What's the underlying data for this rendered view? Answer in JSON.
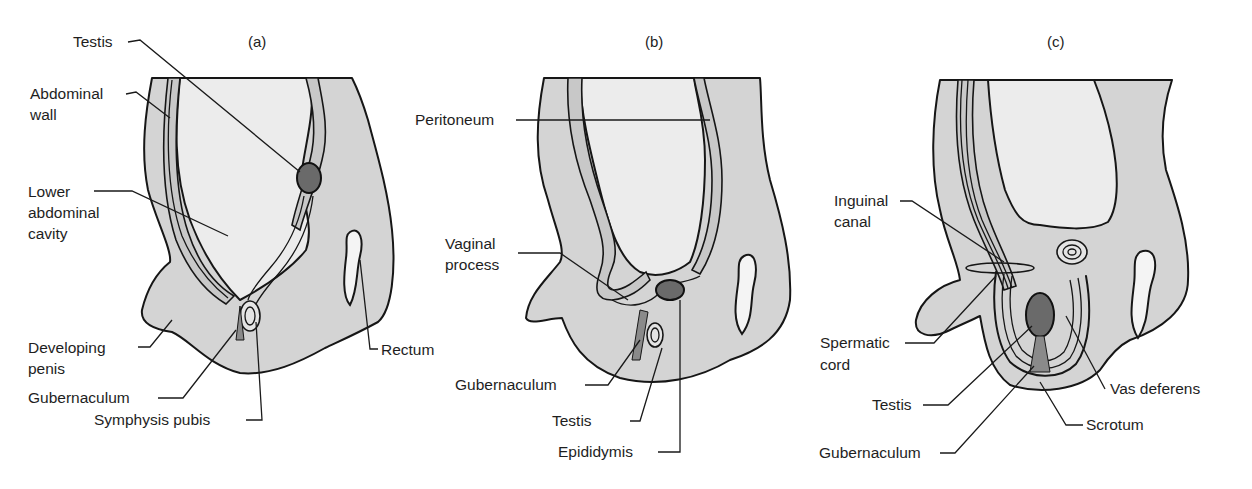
{
  "figure": {
    "colors": {
      "tissue": "#d4d4d4",
      "cavity": "#ececec",
      "outline": "#161616",
      "testis": "#6a6a6a",
      "background": "#ffffff"
    },
    "panels": [
      {
        "id": "a",
        "label": "(a)",
        "labels": {
          "testis": "Testis",
          "abdominal_wall_1": "Abdominal",
          "abdominal_wall_2": "wall",
          "lower_cavity_1": "Lower",
          "lower_cavity_2": "abdominal",
          "lower_cavity_3": "cavity",
          "penis_1": "Developing",
          "penis_2": "penis",
          "gubernaculum": "Gubernaculum",
          "symphysis": "Symphysis pubis",
          "rectum": "Rectum"
        }
      },
      {
        "id": "b",
        "label": "(b)",
        "labels": {
          "peritoneum": "Peritoneum",
          "vaginal_1": "Vaginal",
          "vaginal_2": "process",
          "gubernaculum": "Gubernaculum",
          "testis": "Testis",
          "epididymis": "Epididymis"
        }
      },
      {
        "id": "c",
        "label": "(c)",
        "labels": {
          "inguinal_1": "Inguinal",
          "inguinal_2": "canal",
          "spermatic_1": "Spermatic",
          "spermatic_2": "cord",
          "testis": "Testis",
          "gubernaculum": "Gubernaculum",
          "vas_deferens": "Vas deferens",
          "scrotum": "Scrotum"
        }
      }
    ]
  }
}
